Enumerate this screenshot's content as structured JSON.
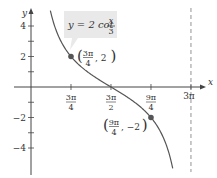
{
  "chart_data": {
    "type": "line",
    "title": "",
    "function_label": {
      "lhs": "y = 2 cot",
      "num": "x",
      "den": "3"
    },
    "xlabel": "x",
    "ylabel": "y",
    "xlim": [
      0,
      9.4248
    ],
    "ylim": [
      -5.5,
      5.5
    ],
    "grid": false,
    "x_ticks": [
      {
        "value": 2.3562,
        "num": "3π",
        "den": "4"
      },
      {
        "value": 4.7124,
        "num": "3π",
        "den": "2"
      },
      {
        "value": 7.0686,
        "num": "9π",
        "den": "4"
      },
      {
        "value": 9.4248,
        "text": "3π"
      }
    ],
    "y_ticks": [
      {
        "value": 4,
        "text": "4"
      },
      {
        "value": 3,
        "text": ""
      },
      {
        "value": 2,
        "text": "2"
      },
      {
        "value": 1,
        "text": ""
      },
      {
        "value": -1,
        "text": ""
      },
      {
        "value": -2,
        "text": "−2"
      },
      {
        "value": -3,
        "text": ""
      },
      {
        "value": -4,
        "text": "−4"
      }
    ],
    "asymptotes": [
      {
        "x": 9.4248,
        "style": "dashed"
      }
    ],
    "series": [
      {
        "name": "y = 2cot(x/3)",
        "function": "2*cot(x/3)",
        "domain": [
          1.14,
          8.35
        ],
        "color": "#555555"
      }
    ],
    "points": [
      {
        "x": 2.3562,
        "y": 2,
        "num": "3π",
        "den": "4",
        "yText": "2"
      },
      {
        "x": 7.0686,
        "y": -2,
        "num": "9π",
        "den": "4",
        "yText": "−2"
      }
    ],
    "colors": {
      "axis": "#444444",
      "curve": "#555555",
      "point": "#555555",
      "label_box": "#e8e8e8",
      "asymptote": "#888888"
    }
  }
}
